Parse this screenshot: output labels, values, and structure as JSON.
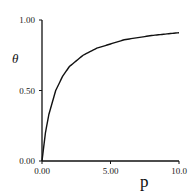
{
  "chart_data": {
    "type": "line",
    "title": "",
    "xlabel": "p",
    "ylabel": "θ",
    "xlim": [
      0,
      10
    ],
    "ylim": [
      0,
      1
    ],
    "grid": false,
    "legend": null,
    "x_ticks": [
      "0.00",
      "5.00",
      "10.0"
    ],
    "y_ticks": [
      "0.00",
      "0.50",
      "1.00"
    ],
    "series": [
      {
        "name": "θ(p)",
        "x": [
          0,
          0.25,
          0.5,
          1,
          1.5,
          2,
          3,
          4,
          5,
          6,
          7,
          8,
          9,
          10
        ],
        "y": [
          0,
          0.2,
          0.33,
          0.5,
          0.6,
          0.67,
          0.75,
          0.8,
          0.83,
          0.86,
          0.875,
          0.89,
          0.9,
          0.91
        ]
      }
    ]
  }
}
